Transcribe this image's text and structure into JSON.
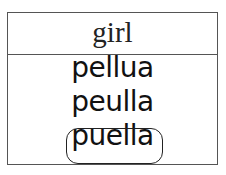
{
  "prompt": {
    "word": "girl"
  },
  "options": [
    {
      "text": "pellua",
      "selected": false
    },
    {
      "text": "peulla",
      "selected": false
    },
    {
      "text": "puella",
      "selected": true
    }
  ]
}
